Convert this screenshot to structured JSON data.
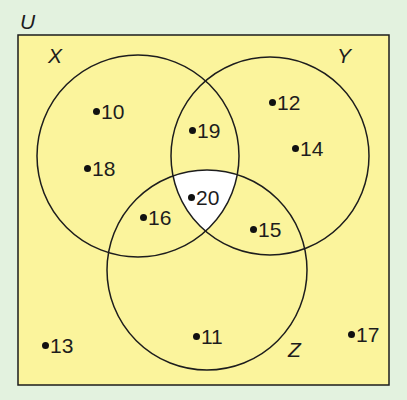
{
  "diagram": {
    "type": "venn",
    "universal_label": "U",
    "sets": [
      {
        "name": "X",
        "label": "X"
      },
      {
        "name": "Y",
        "label": "Y"
      },
      {
        "name": "Z",
        "label": "Z"
      }
    ],
    "highlighted_region": "X ∩ Y ∩ Z",
    "elements": {
      "only_X": [
        "10",
        "18"
      ],
      "only_Y": [
        "12",
        "14"
      ],
      "only_Z": [
        "11"
      ],
      "X_and_Y_only": [
        "19"
      ],
      "X_and_Z_only": [
        "16"
      ],
      "Y_and_Z_only": [
        "15"
      ],
      "X_and_Y_and_Z": [
        "20"
      ],
      "outside": [
        "13",
        "17"
      ]
    },
    "colors": {
      "background": "#e3f2df",
      "universe_fill": "#fbf49c",
      "highlight_fill": "#ffffff",
      "stroke": "#1d1d1d"
    }
  },
  "labels": {
    "U": "U",
    "X": "X",
    "Y": "Y",
    "Z": "Z",
    "e10": "10",
    "e18": "18",
    "e12": "12",
    "e14": "14",
    "e19": "19",
    "e20": "20",
    "e16": "16",
    "e15": "15",
    "e11": "11",
    "e13": "13",
    "e17": "17"
  }
}
